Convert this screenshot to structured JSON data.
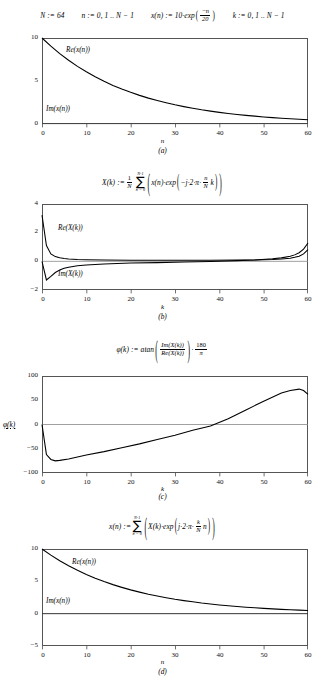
{
  "header": {
    "def_N": "N := 64",
    "def_n": "n := 0, 1 .. N − 1",
    "def_x_lead": "x(n) := 10·exp",
    "def_x_num": "−n",
    "def_x_den": "20",
    "def_k": "k := 0, 1 .. N − 1"
  },
  "equations": {
    "dft": {
      "lhs": "X(k) :=",
      "coef_num": "1",
      "coef_den": "N",
      "sum_upper": "N-1",
      "sum_lower": "n = 0",
      "body_lead": "x(n)·exp",
      "body_arg_lead": "−j·2·π·",
      "body_frac_num": "n",
      "body_frac_den": "N",
      "body_arg_tail": "k"
    },
    "phase": {
      "lhs": "φ(k) := atan",
      "num": "Im(X(k))",
      "den": "Re(X(k))",
      "mult": "·",
      "deg_num": "180",
      "deg_den": "π"
    },
    "idft": {
      "lhs": "x(n) :=",
      "sum_upper": "N-1",
      "sum_lower": "n = 0",
      "body_lead": "X(k)·exp",
      "body_arg_lead": "j·2·π·",
      "body_frac_num": "k",
      "body_frac_den": "N",
      "body_arg_tail": "n"
    }
  },
  "panels": [
    {
      "id": "a",
      "label": "(a)",
      "xlabel": "n",
      "ylabel": "",
      "yticks": [
        "10",
        "5",
        "0"
      ],
      "xticks": [
        "0",
        "10",
        "20",
        "30",
        "40",
        "50",
        "60"
      ],
      "curve_labels": [
        "Re(x(n))",
        "Im(x(n))"
      ]
    },
    {
      "id": "b",
      "label": "(b)",
      "xlabel": "k",
      "ylabel": "",
      "yticks": [
        "4",
        "2",
        "0",
        "−2"
      ],
      "xticks": [
        "0",
        "10",
        "20",
        "30",
        "40",
        "50",
        "60"
      ],
      "curve_labels": [
        "Re(X(k))",
        "Im(X(k))"
      ]
    },
    {
      "id": "c",
      "label": "(c)",
      "xlabel": "k",
      "ylabel": "φ(k)",
      "yticks": [
        "100",
        "50",
        "0",
        "−50",
        "−100"
      ],
      "xticks": [
        "0",
        "10",
        "20",
        "30",
        "40",
        "50",
        "60"
      ],
      "curve_labels": []
    },
    {
      "id": "d",
      "label": "(d)",
      "xlabel": "n",
      "ylabel": "",
      "yticks": [
        "10",
        "5",
        "0",
        "−5"
      ],
      "xticks": [
        "0",
        "10",
        "20",
        "30",
        "40",
        "50",
        "60"
      ],
      "curve_labels": [
        "Re(x(n))",
        "Im(x(n))"
      ]
    }
  ],
  "chart_data": [
    {
      "type": "line",
      "panel": "a",
      "title": "",
      "xlabel": "n",
      "ylabel": "",
      "xlim": [
        0,
        60
      ],
      "ylim": [
        0,
        10
      ],
      "grid": false,
      "legend": "inline-annotations",
      "series": [
        {
          "name": "Re(x(n))",
          "x": [
            0,
            2,
            4,
            6,
            8,
            10,
            12,
            14,
            16,
            18,
            20,
            22,
            24,
            26,
            28,
            30,
            32,
            34,
            36,
            38,
            40,
            42,
            44,
            46,
            48,
            50,
            52,
            54,
            56,
            58,
            60
          ],
          "values": [
            10.0,
            9.05,
            8.19,
            7.41,
            6.7,
            6.07,
            5.49,
            4.97,
            4.49,
            4.07,
            3.68,
            3.33,
            3.01,
            2.73,
            2.47,
            2.23,
            2.02,
            1.83,
            1.65,
            1.5,
            1.35,
            1.22,
            1.11,
            1.0,
            0.91,
            0.82,
            0.74,
            0.67,
            0.61,
            0.55,
            0.5
          ]
        },
        {
          "name": "Im(x(n))",
          "x": [
            0,
            60
          ],
          "values": [
            0,
            0
          ]
        }
      ]
    },
    {
      "type": "line",
      "panel": "b",
      "title": "",
      "xlabel": "k",
      "ylabel": "",
      "xlim": [
        0,
        60
      ],
      "ylim": [
        -2,
        4
      ],
      "grid": false,
      "legend": "inline-annotations",
      "series": [
        {
          "name": "Re(X(k))",
          "x": [
            0,
            1,
            2,
            3,
            4,
            5,
            6,
            8,
            10,
            14,
            20,
            26,
            32,
            38,
            44,
            48,
            52,
            54,
            56,
            57,
            58,
            59,
            60
          ],
          "values": [
            3.22,
            1.1,
            0.52,
            0.33,
            0.25,
            0.2,
            0.17,
            0.13,
            0.11,
            0.09,
            0.08,
            0.08,
            0.08,
            0.08,
            0.09,
            0.1,
            0.13,
            0.16,
            0.22,
            0.28,
            0.36,
            0.52,
            0.82
          ]
        },
        {
          "name": "Im(X(k))",
          "x": [
            0,
            1,
            2,
            3,
            4,
            5,
            6,
            8,
            10,
            14,
            20,
            26,
            32,
            38,
            44,
            48,
            52,
            54,
            56,
            57,
            58,
            59,
            60
          ],
          "values": [
            0.0,
            -1.3,
            -1.05,
            -0.78,
            -0.6,
            -0.49,
            -0.41,
            -0.31,
            -0.25,
            -0.18,
            -0.12,
            -0.09,
            -0.05,
            -0.01,
            0.05,
            0.1,
            0.18,
            0.24,
            0.35,
            0.45,
            0.6,
            0.85,
            1.28
          ]
        }
      ]
    },
    {
      "type": "line",
      "panel": "c",
      "title": "",
      "xlabel": "k",
      "ylabel": "φ(k)",
      "xlim": [
        0,
        60
      ],
      "ylim": [
        -100,
        100
      ],
      "grid": false,
      "legend": "none",
      "series": [
        {
          "name": "φ(k)",
          "x": [
            0,
            1,
            2,
            3,
            4,
            6,
            8,
            10,
            14,
            18,
            22,
            26,
            30,
            34,
            38,
            42,
            46,
            50,
            54,
            56,
            58,
            59,
            60
          ],
          "values": [
            0,
            -62,
            -72,
            -75,
            -74,
            -71,
            -67,
            -63,
            -56,
            -48,
            -40,
            -31,
            -22,
            -12,
            -3,
            12,
            30,
            48,
            65,
            70,
            73,
            70,
            62
          ]
        }
      ]
    },
    {
      "type": "line",
      "panel": "d",
      "title": "",
      "xlabel": "n",
      "ylabel": "",
      "xlim": [
        0,
        60
      ],
      "ylim": [
        -5,
        10
      ],
      "grid": false,
      "legend": "inline-annotations",
      "series": [
        {
          "name": "Re(x(n))",
          "x": [
            0,
            2,
            4,
            6,
            8,
            10,
            12,
            14,
            16,
            18,
            20,
            22,
            24,
            26,
            28,
            30,
            32,
            34,
            36,
            38,
            40,
            42,
            44,
            46,
            48,
            50,
            52,
            54,
            56,
            58,
            60
          ],
          "values": [
            10.0,
            9.05,
            8.19,
            7.41,
            6.7,
            6.07,
            5.49,
            4.97,
            4.49,
            4.07,
            3.68,
            3.33,
            3.01,
            2.73,
            2.47,
            2.23,
            2.02,
            1.83,
            1.65,
            1.5,
            1.35,
            1.22,
            1.11,
            1.0,
            0.91,
            0.82,
            0.74,
            0.67,
            0.61,
            0.55,
            0.5
          ]
        },
        {
          "name": "Im(x(n))",
          "x": [
            0,
            60
          ],
          "values": [
            0,
            0
          ]
        }
      ]
    }
  ]
}
